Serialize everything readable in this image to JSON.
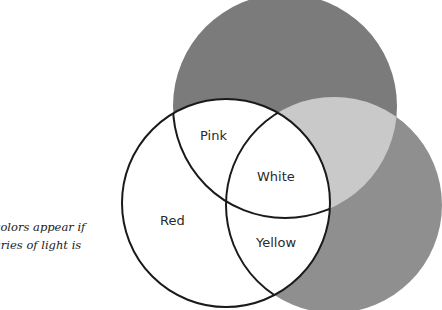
{
  "caption": {
    "line1": "colors appear if",
    "line2": "aries of light is"
  },
  "diagram": {
    "regions": [
      {
        "id": "red",
        "label": "Red"
      },
      {
        "id": "pink",
        "label": "Pink"
      },
      {
        "id": "white",
        "label": "White"
      },
      {
        "id": "yellow",
        "label": "Yellow"
      }
    ],
    "colors": {
      "top_circle": "#7b7b7b",
      "right_circle": "#8f8f8f",
      "gray_overlap": "#c9c9c9",
      "outline": "#1a1a1a",
      "fill": "#ffffff"
    }
  }
}
